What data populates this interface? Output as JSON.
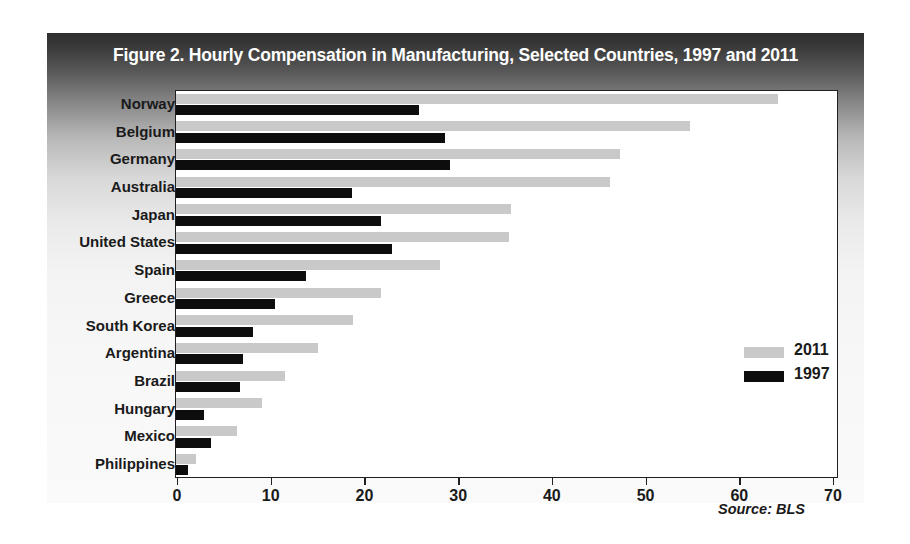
{
  "figure": {
    "title": "Figure 2. Hourly Compensation in Manufacturing, Selected Countries, 1997 and 2011",
    "source": "Source: BLS"
  },
  "legend": {
    "position": "middle-right",
    "entries": [
      {
        "label": "2011",
        "color": "#c9c9c9"
      },
      {
        "label": "1997",
        "color": "#0d0d0d"
      }
    ]
  },
  "axis": {
    "x_ticks": [
      "0",
      "10",
      "20",
      "30",
      "40",
      "50",
      "60",
      "70"
    ]
  },
  "chart_data": {
    "type": "bar",
    "orientation": "horizontal",
    "title": "Figure 2. Hourly Compensation in Manufacturing, Selected Countries, 1997 and 2011",
    "xlabel": "",
    "ylabel": "",
    "xlim": [
      0,
      70
    ],
    "grid": false,
    "legend_position": "middle-right",
    "categories": [
      "Norway",
      "Belgium",
      "Germany",
      "Australia",
      "Japan",
      "United States",
      "Spain",
      "Greece",
      "South Korea",
      "Argentina",
      "Brazil",
      "Hungary",
      "Mexico",
      "Philippines"
    ],
    "series": [
      {
        "name": "2011",
        "color": "#c9c9c9",
        "values": [
          64.2,
          54.8,
          47.4,
          46.3,
          35.7,
          35.5,
          28.2,
          21.9,
          18.9,
          15.1,
          11.6,
          9.2,
          6.5,
          2.1
        ]
      },
      {
        "name": "1997",
        "color": "#0d0d0d",
        "values": [
          25.9,
          28.7,
          29.2,
          18.8,
          21.9,
          23.0,
          13.9,
          10.6,
          8.2,
          7.2,
          6.8,
          3.0,
          3.7,
          1.3
        ]
      }
    ]
  }
}
